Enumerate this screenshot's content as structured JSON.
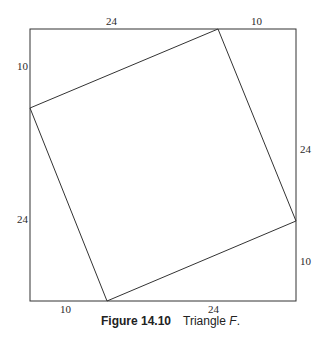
{
  "figure": {
    "outer_square": {
      "x1": 30,
      "y1": 29,
      "x2": 296,
      "y2": 301
    },
    "inner_square": {
      "vertices": [
        [
          218,
          29
        ],
        [
          296,
          221
        ],
        [
          107,
          301
        ],
        [
          30,
          108
        ]
      ]
    },
    "stroke_color": "#333333",
    "labels": {
      "top_left": "24",
      "top_right": "10",
      "left_top": "10",
      "left_bottom": "24",
      "right_top": "24",
      "right_bottom": "10",
      "bottom_left": "10",
      "bottom_right": "24"
    }
  },
  "caption": {
    "number": "Figure 14.10",
    "text": "Triangle ",
    "italic": "F",
    "end": "."
  }
}
